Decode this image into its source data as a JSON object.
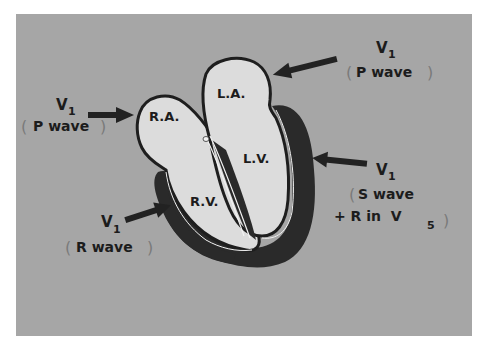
{
  "diagram": {
    "background_color": "#a6a6a6",
    "chamber_fill": "#dcdcdc",
    "muscle_color": "#2a2a2a",
    "chambers": {
      "ra": "R.A.",
      "la": "L.A.",
      "lv": "L.V.",
      "rv": "R.V."
    },
    "annotations": [
      {
        "id": "ra",
        "lead": "V",
        "sub": "1",
        "wave": "P wave",
        "target": "R.A."
      },
      {
        "id": "la",
        "lead": "V",
        "sub": "1",
        "wave": "P wave",
        "target": "L.A."
      },
      {
        "id": "lv",
        "lead": "V",
        "sub": "1",
        "wave_line1": "S wave",
        "wave_line2": "+ R in  V",
        "wave_line2_sub": "5",
        "target": "L.V."
      },
      {
        "id": "rv",
        "lead": "V",
        "sub": "1",
        "wave": "R wave",
        "target": "R.V."
      }
    ]
  }
}
